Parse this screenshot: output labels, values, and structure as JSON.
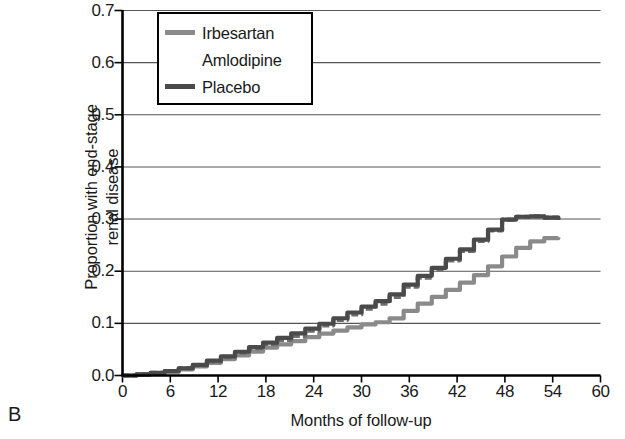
{
  "panel": {
    "letter": "B"
  },
  "chart_data": {
    "type": "line",
    "title": "",
    "subtitle": "",
    "xlabel": "Months of follow-up",
    "ylabel": "Proportion with end-stage renal disease",
    "ylabel_lines": [
      "Proportion with end-stage",
      "renal disease"
    ],
    "xlim": [
      0,
      60
    ],
    "ylim": [
      0,
      0.7
    ],
    "xticks": [
      0,
      6,
      12,
      18,
      24,
      30,
      36,
      42,
      48,
      54,
      60
    ],
    "xtick_labels": [
      "0",
      "6",
      "12",
      "18",
      "24",
      "30",
      "36",
      "42",
      "48",
      "54",
      "60"
    ],
    "yticks": [
      0.0,
      0.1,
      0.2,
      0.3,
      0.4,
      0.5,
      0.6,
      0.7
    ],
    "ytick_labels": [
      "0.0",
      "0.1",
      "0.2",
      "0.3",
      "0.4",
      "0.5",
      "0.6",
      "0.7"
    ],
    "grid": "horizontal",
    "legend_position": "top-left-inside",
    "series": [
      {
        "name": "Irbesartan",
        "color": "#8a8a8a",
        "style": "solid",
        "x": [
          0,
          3,
          6,
          9,
          12,
          15,
          18,
          21,
          24,
          27,
          30,
          33,
          36,
          39,
          42,
          45,
          48,
          50,
          52,
          54,
          56
        ],
        "y": [
          0.0,
          0.003,
          0.008,
          0.018,
          0.03,
          0.042,
          0.055,
          0.065,
          0.078,
          0.088,
          0.098,
          0.105,
          0.13,
          0.152,
          0.175,
          0.2,
          0.232,
          0.25,
          0.262,
          0.265,
          0.265
        ]
      },
      {
        "name": "Amlodipine",
        "color": "#6e6e6e",
        "style": "dashed",
        "x": [
          0,
          3,
          6,
          9,
          12,
          15,
          18,
          21,
          24,
          27,
          30,
          33,
          36,
          39,
          42,
          45,
          48,
          50,
          52,
          54,
          56
        ],
        "y": [
          0.0,
          0.004,
          0.01,
          0.02,
          0.033,
          0.048,
          0.062,
          0.075,
          0.092,
          0.11,
          0.128,
          0.145,
          0.178,
          0.205,
          0.235,
          0.268,
          0.303,
          0.305,
          0.305,
          0.3,
          0.295
        ]
      },
      {
        "name": "Placebo",
        "color": "#4a4a4a",
        "style": "solid",
        "x": [
          0,
          3,
          6,
          9,
          12,
          15,
          18,
          21,
          24,
          27,
          30,
          33,
          36,
          39,
          42,
          45,
          48,
          50,
          52,
          54,
          56
        ],
        "y": [
          0.0,
          0.004,
          0.01,
          0.021,
          0.035,
          0.05,
          0.065,
          0.08,
          0.095,
          0.113,
          0.132,
          0.15,
          0.182,
          0.208,
          0.238,
          0.27,
          0.303,
          0.305,
          0.305,
          0.3,
          0.295
        ]
      }
    ]
  },
  "legend": {
    "items": [
      {
        "label": "Irbesartan",
        "color": "#8a8a8a",
        "style": "solid"
      },
      {
        "label": "Amlodipine",
        "color": "#6e6e6e",
        "style": "dashed"
      },
      {
        "label": "Placebo",
        "color": "#4a4a4a",
        "style": "solid"
      }
    ]
  },
  "axes": {
    "axis_color": "#000000",
    "grid_color": "#555555"
  }
}
